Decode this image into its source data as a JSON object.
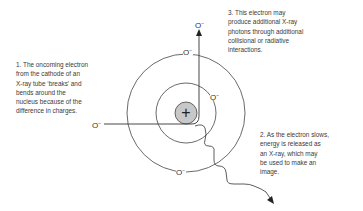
{
  "diagram": {
    "nucleus_symbol": "+",
    "electron_symbol": "O",
    "electron_charge": "−",
    "colors": {
      "line": "#333333",
      "nucleus_fill": "#c8c8c8",
      "text": "#3a3a3a"
    },
    "notes": [
      {
        "id": "1",
        "text": "1. The oncoming electron\nfrom the cathode of an\nX-ray tube ‘breaks’ and\nbends around the\nnucleus because of the\ndifference in charges."
      },
      {
        "id": "2",
        "text": "2. As the electron slows,\nenergy is released as\nan X-ray, which may\nbe used to make an\nimage."
      },
      {
        "id": "3",
        "text": "3. This electron may\nproduce additional X-ray\nphotons through additional\ncollisional or radiative\ninteractions."
      }
    ]
  }
}
